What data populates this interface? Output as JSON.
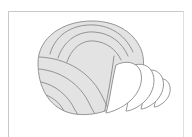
{
  "canvas": {
    "width": 192,
    "height": 137,
    "background_color": "#ffffff"
  },
  "frame": {
    "name": "page-border",
    "stroke_color": "#c9c9c9",
    "stroke_width": 1,
    "left_x": 8,
    "top_y": 11,
    "right_x": 184,
    "bottom_y": 137,
    "visible_edges": "top-and-left"
  },
  "illustration": {
    "title": "Seashell line drawing",
    "subject": "seashell",
    "style": "line-art",
    "body": {
      "name": "shell-body",
      "fill_color": "#e3e3e3",
      "stroke_color": "#8a8a8a",
      "stroke_width": 0.9,
      "outline_path": "M 38 63 C 38 38, 62 21, 92 21 C 118 21, 136 34, 142 52 C 146 66, 142 84, 130 96 C 115 111, 90 118, 70 113 C 48 107, 38 86, 38 63 Z"
    },
    "arc_bands_top": {
      "name": "top-growth-arcs",
      "count": 3,
      "stroke_color": "#8a8a8a",
      "stroke_width": 0.9,
      "paths": [
        "M 50 54 C 56 32, 76 24, 94 25 C 112 26, 126 36, 133 52",
        "M 58 58 C 64 39, 80 31, 94 32 C 110 33, 122 42, 128 56",
        "M 67 62 C 72 47, 83 40, 94 41 C 106 42, 116 49, 121 60"
      ]
    },
    "arc_bands_lower_left": {
      "name": "lower-left-growth-arcs",
      "count": 4,
      "stroke_color": "#8a8a8a",
      "stroke_width": 0.9,
      "paths": [
        "M 39 57 C 66 58, 92 72, 104 100 C 108 108, 110 113, 111 116",
        "M 39 69 C 60 71, 80 83, 90 105 C 93 111, 95 114, 96 116",
        "M 41 82 C 55 85, 68 95, 75 110 C 77 113, 78 115, 79 116",
        "M 46 95 C 54 98, 61 104, 65 113"
      ]
    },
    "fan_lobes": {
      "name": "shell-fan-lobes",
      "count": 4,
      "fill_color": "#ffffff",
      "stroke_color": "#8a8a8a",
      "stroke_width": 0.9,
      "paths": [
        "M 116 65 C 126 60, 136 62, 140 70 C 144 80, 140 92, 130 101 C 122 108, 112 112, 106 113 C 110 100, 112 80, 116 65 Z",
        "M 131 66 C 141 62, 150 65, 153 74 C 156 84, 152 95, 143 103 C 137 108, 130 111, 126 111 C 130 98, 128 78, 131 66 Z",
        "M 145 71 C 154 68, 161 72, 163 80 C 165 88, 161 97, 154 103 C 149 107, 144 109, 141 109 C 145 97, 143 81, 145 71 Z",
        "M 157 79 C 164 77, 169 81, 170 87 C 171 93, 168 99, 163 103 C 159 106, 156 107, 154 107 C 157 98, 156 85, 157 79 Z"
      ]
    },
    "fan_divider": {
      "name": "fan-body-divider",
      "stroke_color": "#8a8a8a",
      "stroke_width": 0.9,
      "path": "M 114 56 C 112 72, 108 96, 104 114"
    }
  }
}
